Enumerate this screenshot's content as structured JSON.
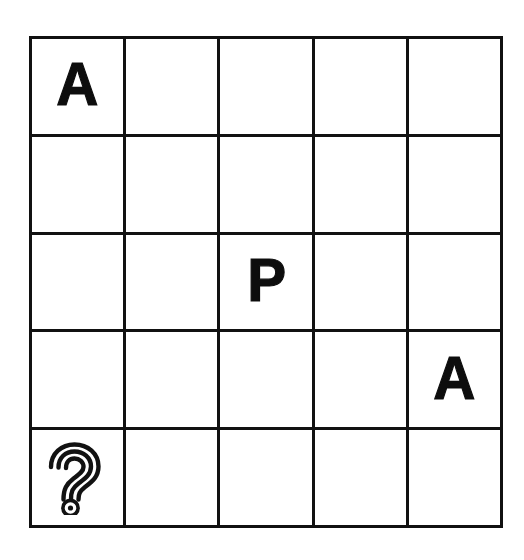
{
  "board": {
    "title": "5x5 grid puzzle",
    "rows": 5,
    "columns": 5,
    "line_color": "#111111",
    "background_color": "#ffffff",
    "glyph_color": "#0d0d0d",
    "cells": [
      [
        {
          "id": "r1c1",
          "type": "letter",
          "label": "A"
        },
        {
          "id": "r1c2",
          "type": "empty",
          "label": ""
        },
        {
          "id": "r1c3",
          "type": "empty",
          "label": ""
        },
        {
          "id": "r1c4",
          "type": "empty",
          "label": ""
        },
        {
          "id": "r1c5",
          "type": "empty",
          "label": ""
        }
      ],
      [
        {
          "id": "r2c1",
          "type": "empty",
          "label": ""
        },
        {
          "id": "r2c2",
          "type": "empty",
          "label": ""
        },
        {
          "id": "r2c3",
          "type": "empty",
          "label": ""
        },
        {
          "id": "r2c4",
          "type": "empty",
          "label": ""
        },
        {
          "id": "r2c5",
          "type": "empty",
          "label": ""
        }
      ],
      [
        {
          "id": "r3c1",
          "type": "empty",
          "label": ""
        },
        {
          "id": "r3c2",
          "type": "empty",
          "label": ""
        },
        {
          "id": "r3c3",
          "type": "letter",
          "label": "P"
        },
        {
          "id": "r3c4",
          "type": "empty",
          "label": ""
        },
        {
          "id": "r3c5",
          "type": "empty",
          "label": ""
        }
      ],
      [
        {
          "id": "r4c1",
          "type": "empty",
          "label": ""
        },
        {
          "id": "r4c2",
          "type": "empty",
          "label": ""
        },
        {
          "id": "r4c3",
          "type": "empty",
          "label": ""
        },
        {
          "id": "r4c4",
          "type": "empty",
          "label": ""
        },
        {
          "id": "r4c5",
          "type": "letter",
          "label": "A"
        }
      ],
      [
        {
          "id": "r5c1",
          "type": "icon",
          "label": "",
          "icon": "question-mark-icon"
        },
        {
          "id": "r5c2",
          "type": "empty",
          "label": ""
        },
        {
          "id": "r5c3",
          "type": "empty",
          "label": ""
        },
        {
          "id": "r5c4",
          "type": "empty",
          "label": ""
        },
        {
          "id": "r5c5",
          "type": "empty",
          "label": ""
        }
      ]
    ]
  }
}
